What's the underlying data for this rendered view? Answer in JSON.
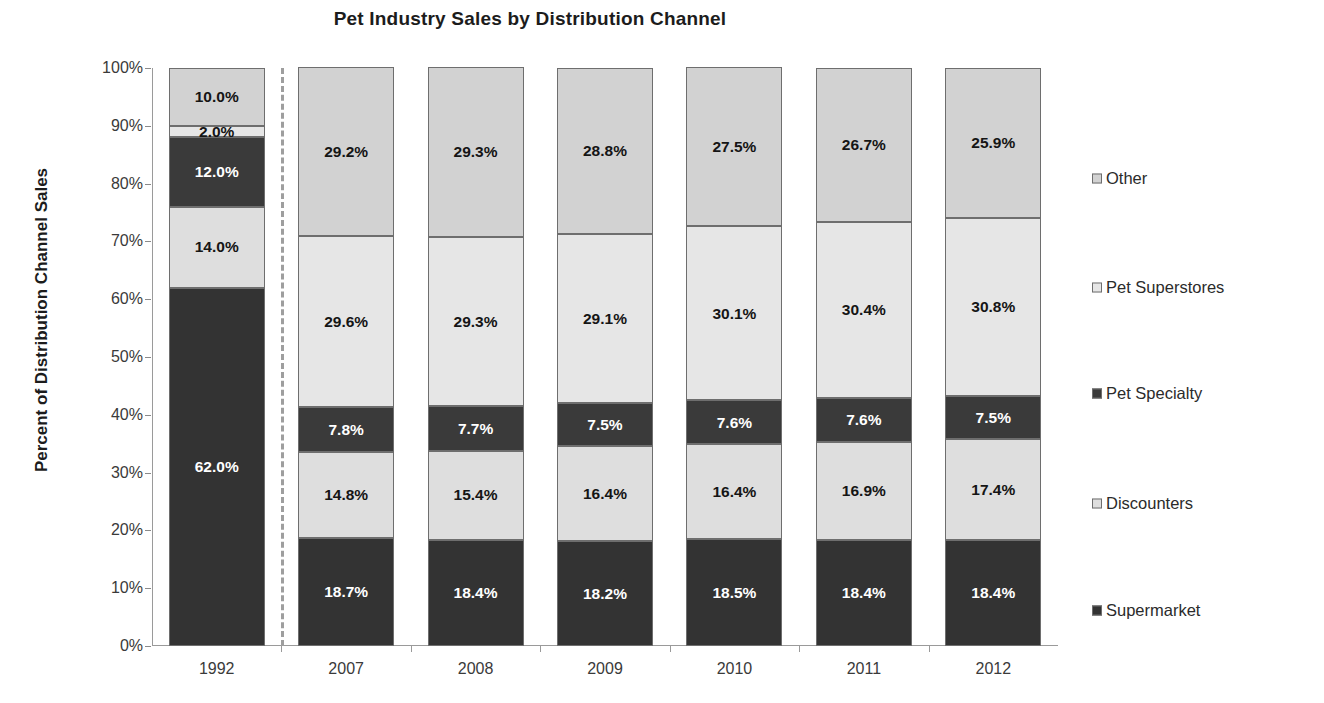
{
  "chart_data": {
    "type": "bar",
    "subtype": "stacked-100-percent",
    "title": "Pet Industry Sales by Distribution Channel",
    "xlabel": "",
    "ylabel": "Percent of Distribution Channel Sales",
    "ylim": [
      0,
      100
    ],
    "ytick_labels": [
      "0%",
      "10%",
      "20%",
      "30%",
      "40%",
      "50%",
      "60%",
      "70%",
      "80%",
      "90%",
      "100%"
    ],
    "ytick_values": [
      0,
      10,
      20,
      30,
      40,
      50,
      60,
      70,
      80,
      90,
      100
    ],
    "grid": false,
    "legend_position": "right",
    "categories": [
      "1992",
      "2007",
      "2008",
      "2009",
      "2010",
      "2011",
      "2012"
    ],
    "series": [
      {
        "name": "Supermarket",
        "color": "#333333",
        "label_color": "light",
        "values": [
          62.0,
          18.7,
          18.4,
          18.2,
          18.5,
          18.4,
          18.4
        ],
        "labels": [
          "62.0%",
          "18.7%",
          "18.4%",
          "18.2%",
          "18.5%",
          "18.4%",
          "18.4%"
        ]
      },
      {
        "name": "Discounters",
        "color": "#dedede",
        "label_color": "dark",
        "values": [
          14.0,
          14.8,
          15.4,
          16.4,
          16.4,
          16.9,
          17.4
        ],
        "labels": [
          "14.0%",
          "14.8%",
          "15.4%",
          "16.4%",
          "16.4%",
          "16.9%",
          "17.4%"
        ]
      },
      {
        "name": "Pet Specialty",
        "color": "#3a3a3a",
        "label_color": "light",
        "values": [
          12.0,
          7.8,
          7.7,
          7.5,
          7.6,
          7.6,
          7.5
        ],
        "labels": [
          "12.0%",
          "7.8%",
          "7.7%",
          "7.5%",
          "7.6%",
          "7.6%",
          "7.5%"
        ]
      },
      {
        "name": "Pet Superstores",
        "color": "#e6e6e6",
        "label_color": "dark",
        "values": [
          2.0,
          29.6,
          29.3,
          29.1,
          30.1,
          30.4,
          30.8
        ],
        "labels": [
          "2.0%",
          "29.6%",
          "29.3%",
          "29.1%",
          "30.1%",
          "30.4%",
          "30.8%"
        ]
      },
      {
        "name": "Other",
        "color": "#d2d2d2",
        "label_color": "dark",
        "values": [
          10.0,
          29.2,
          29.3,
          28.8,
          27.5,
          26.7,
          25.9
        ],
        "labels": [
          "10.0%",
          "29.2%",
          "29.3%",
          "28.8%",
          "27.5%",
          "26.7%",
          "25.9%"
        ]
      }
    ],
    "legend_entries": [
      {
        "label": "Other",
        "color": "#d2d2d2"
      },
      {
        "label": "Pet Superstores",
        "color": "#e6e6e6"
      },
      {
        "label": "Pet Specialty",
        "color": "#3a3a3a"
      },
      {
        "label": "Discounters",
        "color": "#dedede"
      },
      {
        "label": "Supermarket",
        "color": "#333333"
      }
    ],
    "annotations": [
      {
        "type": "vertical-dashed-separator",
        "after_category": "1992"
      }
    ]
  }
}
